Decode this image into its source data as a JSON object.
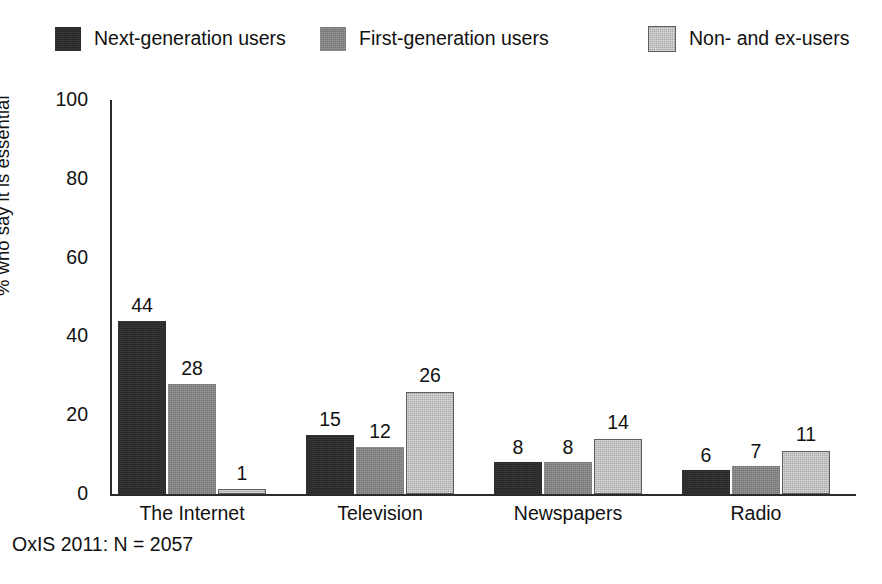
{
  "chart_data": {
    "type": "bar",
    "title": "",
    "subtitle": "",
    "xlabel": "",
    "ylabel": "% who say it is essential",
    "ylim": [
      0,
      100
    ],
    "yticks": [
      100,
      80,
      60,
      40,
      20,
      0
    ],
    "grid": false,
    "legend_position": "top",
    "categories": [
      "The Internet",
      "Television",
      "Newspapers",
      "Radio"
    ],
    "series": [
      {
        "name": "Next-generation users",
        "color": "#252525",
        "values": [
          44,
          15,
          8,
          6
        ]
      },
      {
        "name": "First-generation users",
        "color": "#808080",
        "values": [
          28,
          12,
          8,
          7
        ]
      },
      {
        "name": "Non- and ex-users",
        "color": "#c3c3c3",
        "values": [
          1,
          26,
          14,
          11
        ]
      }
    ],
    "annotations": [
      "OxIS 2011: N = 2057"
    ]
  },
  "legend": {
    "items": [
      {
        "label": "Next-generation users",
        "swatch": "legend-swatch-next-generation"
      },
      {
        "label": "First-generation users",
        "swatch": "legend-swatch-first-generation"
      },
      {
        "label": "Non- and ex-users",
        "swatch": "legend-swatch-non-and-ex"
      }
    ]
  },
  "axes": {
    "y_title": "% who say it is essential",
    "y_tick_labels": [
      "100",
      "80",
      "60",
      "40",
      "20",
      "0"
    ],
    "x_tick_labels": [
      "The Internet",
      "Television",
      "Newspapers",
      "Radio"
    ]
  },
  "footnote": {
    "text": "OxIS 2011: N = 2057"
  }
}
